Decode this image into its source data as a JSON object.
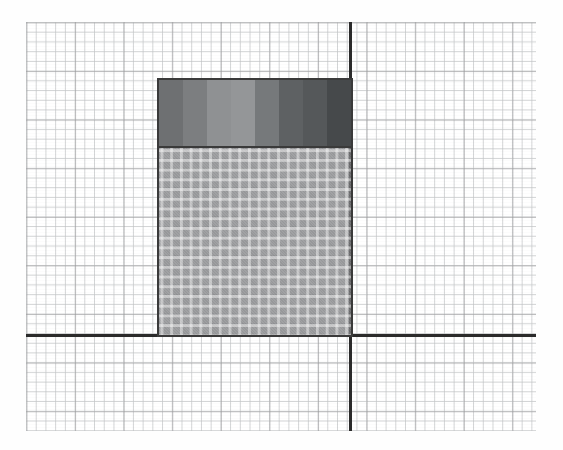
{
  "figure": {
    "background_color": "#ffffff",
    "paper": {
      "name": "graph-paper",
      "minor_grid_color": "#c4c6c8",
      "major_grid_color": "#969698",
      "minor_spacing_px": 9.72,
      "major_every_n_minor": 5,
      "left_px": 26,
      "top_px": 22,
      "width_px": 510,
      "height_px": 409
    },
    "axes": {
      "color": "#2b2b2b",
      "x_axis": {
        "label": "",
        "y_px": 334,
        "thickness_px": 3
      },
      "y_axis": {
        "label": "",
        "x_px": 349,
        "thickness_px": 3
      }
    }
  },
  "chart_data": {
    "type": "bar",
    "title": "",
    "subtitle": "",
    "xlabel": "",
    "ylabel": "",
    "grid": true,
    "legend": "none",
    "categories": [
      "bar-1"
    ],
    "values": [
      26.7
    ],
    "xlim": [
      -13.5,
      19.2
    ],
    "ylim": [
      0,
      42.1
    ],
    "units": "grid squares",
    "bar": {
      "left_grid": -19.8,
      "right_grid": 0.0,
      "top_grid": 26.7,
      "bottom_grid": 0.0,
      "width_grid": 20.0,
      "height_grid": 26.7,
      "outline_color": "#3a3a3a",
      "outline_width_px": 2
    },
    "segments": [
      {
        "name": "upper-banded-segment",
        "from_grid": 19.7,
        "to_grid": 26.7,
        "height_grid": 7.0,
        "fill": "banded-gradient",
        "bands": [
          {
            "index": 1,
            "color": "#6e7072",
            "value": 0.43
          },
          {
            "index": 2,
            "color": "#7c7e80",
            "value": 0.49
          },
          {
            "index": 3,
            "color": "#8f9193",
            "value": 0.56
          },
          {
            "index": 4,
            "color": "#949698",
            "value": 0.58
          },
          {
            "index": 5,
            "color": "#76797b",
            "value": 0.46
          },
          {
            "index": 6,
            "color": "#5e6163",
            "value": 0.37
          },
          {
            "index": 7,
            "color": "#55585a",
            "value": 0.34
          },
          {
            "index": 8,
            "color": "#46494b",
            "value": 0.28
          }
        ]
      },
      {
        "name": "lower-hatched-segment",
        "from_grid": 0.0,
        "to_grid": 19.7,
        "height_grid": 19.7,
        "fill": "translucent-gray-over-grid",
        "color": "#808284",
        "opacity": 0.78,
        "grid_visible_through": true
      }
    ]
  }
}
